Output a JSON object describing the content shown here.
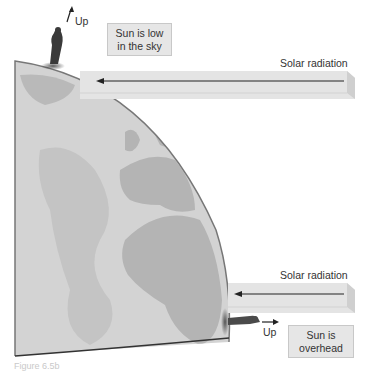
{
  "figure": {
    "labels": {
      "up_top": "Up",
      "up_bottom": "Up",
      "sun_low_line1": "Sun is low",
      "sun_low_line2": "in the sky",
      "sun_overhead_line1": "Sun is",
      "sun_overhead_line2": "overhead",
      "radiation_top": "Solar radiation",
      "radiation_bottom": "Solar radiation"
    },
    "caption": "Figure 6.5b",
    "colors": {
      "ocean": "#d3d3d3",
      "land": "#b4b4b4",
      "outline": "#555555",
      "beam": "#e4e4e4",
      "beam_edge": "#cfcfcf",
      "label_box": "#e6e6e6",
      "arrow": "#222222"
    }
  }
}
